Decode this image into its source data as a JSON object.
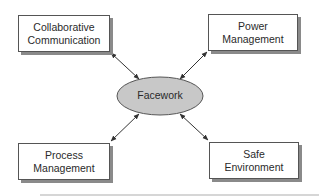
{
  "diagram": {
    "type": "hub-and-spoke",
    "center": {
      "label": "Facework",
      "fill": "#c8c8c8",
      "stroke": "#555555"
    },
    "nodes": [
      {
        "id": "collaborative-communication",
        "line1": "Collaborative",
        "line2": "Communication",
        "position": "top-left"
      },
      {
        "id": "power-management",
        "line1": "Power",
        "line2": "Management",
        "position": "top-right"
      },
      {
        "id": "process-management",
        "line1": "Process",
        "line2": "Management",
        "position": "bottom-left"
      },
      {
        "id": "safe-environment",
        "line1": "Safe",
        "line2": "Environment",
        "position": "bottom-right"
      }
    ],
    "edges": [
      {
        "from": "Facework",
        "to": "Collaborative Communication",
        "arrows": "both"
      },
      {
        "from": "Facework",
        "to": "Power Management",
        "arrows": "both"
      },
      {
        "from": "Facework",
        "to": "Process Management",
        "arrows": "both"
      },
      {
        "from": "Facework",
        "to": "Safe Environment",
        "arrows": "both"
      }
    ],
    "colors": {
      "box_border": "#555555",
      "shadow": "#8a8a8a",
      "text": "#2a2a2a",
      "arrow": "#333333"
    }
  }
}
